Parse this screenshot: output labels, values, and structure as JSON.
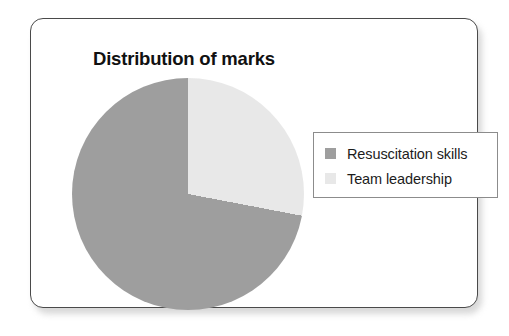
{
  "card": {
    "border_color": "#4a4a4a",
    "background": "#ffffff"
  },
  "chart_data": {
    "type": "pie",
    "title": "Distribution of marks",
    "xlabel": "",
    "ylabel": "",
    "grid": false,
    "legend_position": "right",
    "start_angle_deg": 0,
    "direction": "counterclockwise",
    "categories": [
      "Resuscitation skills",
      "Team leadership"
    ],
    "values": [
      72,
      28
    ],
    "value_unit": "percent",
    "slices": [
      {
        "label": "Resuscitation skills",
        "value": 72,
        "color": "#9e9e9e",
        "sweep_deg": 258
      },
      {
        "label": "Team leadership",
        "value": 28,
        "color": "#e8e8e8",
        "sweep_deg": 102
      }
    ]
  },
  "legend": {
    "items": [
      {
        "label": "Resuscitation skills",
        "color": "#9e9e9e"
      },
      {
        "label": "Team leadership",
        "color": "#e8e8e8"
      }
    ]
  }
}
